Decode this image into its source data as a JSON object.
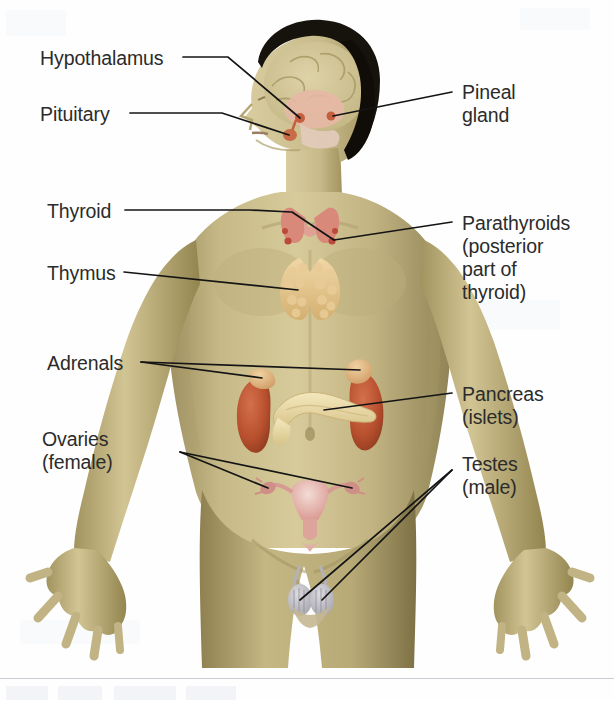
{
  "figure": {
    "background_color": "#fefefe",
    "label_color": "#2b2b2b",
    "leader_line_color": "#1a1a1a",
    "skin_color": "#cfc08a",
    "skin_shadow_color": "#a3966a",
    "hair_color": "#15110c",
    "brain_color": "#d9cfa6",
    "brain_inner_color": "#e8b9a4",
    "thyroid_color": "#d98b7a",
    "thymus_color": "#e2c79a",
    "kidney_color": "#c0583a",
    "adrenal_color": "#dfae7c",
    "pancreas_color": "#ead9a7",
    "uterus_color": "#e4a8a4",
    "testes_color": "#bfbec4"
  },
  "labels": {
    "left": [
      {
        "id": "hypothalamus",
        "text": "Hypothalamus",
        "x": 40,
        "y": 47
      },
      {
        "id": "pituitary",
        "text": "Pituitary",
        "x": 40,
        "y": 103
      },
      {
        "id": "thyroid",
        "text": "Thyroid",
        "x": 47,
        "y": 200
      },
      {
        "id": "thymus",
        "text": "Thymus",
        "x": 47,
        "y": 262
      },
      {
        "id": "adrenals",
        "text": "Adrenals",
        "x": 47,
        "y": 352
      },
      {
        "id": "ovaries",
        "text": "Ovaries\n(female)",
        "x": 42,
        "y": 428
      }
    ],
    "right": [
      {
        "id": "pineal-gland",
        "text": "Pineal\ngland",
        "x": 462,
        "y": 81
      },
      {
        "id": "parathyroids",
        "text": "Parathyroids\n(posterior\npart of\nthyroid)",
        "x": 462,
        "y": 212
      },
      {
        "id": "pancreas",
        "text": "Pancreas\n(islets)",
        "x": 462,
        "y": 383
      },
      {
        "id": "testes",
        "text": "Testes\n(male)",
        "x": 462,
        "y": 453
      }
    ]
  },
  "glands": [
    {
      "id": "hypothalamus",
      "name": "Hypothalamus",
      "region": "brain"
    },
    {
      "id": "pituitary",
      "name": "Pituitary",
      "region": "brain"
    },
    {
      "id": "pineal-gland",
      "name": "Pineal gland",
      "region": "brain"
    },
    {
      "id": "thyroid",
      "name": "Thyroid",
      "region": "neck"
    },
    {
      "id": "parathyroids",
      "name": "Parathyroids",
      "region": "neck"
    },
    {
      "id": "thymus",
      "name": "Thymus",
      "region": "chest"
    },
    {
      "id": "adrenals",
      "name": "Adrenals",
      "region": "abdomen"
    },
    {
      "id": "pancreas",
      "name": "Pancreas (islets)",
      "region": "abdomen"
    },
    {
      "id": "ovaries",
      "name": "Ovaries (female)",
      "region": "pelvis"
    },
    {
      "id": "testes",
      "name": "Testes (male)",
      "region": "pelvis"
    }
  ]
}
